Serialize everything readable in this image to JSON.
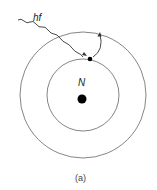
{
  "diagram": {
    "photon_label": "hf",
    "nucleus_label": "N",
    "caption": "(a)",
    "colors": {
      "line": "#555555",
      "dot": "#000000"
    }
  }
}
